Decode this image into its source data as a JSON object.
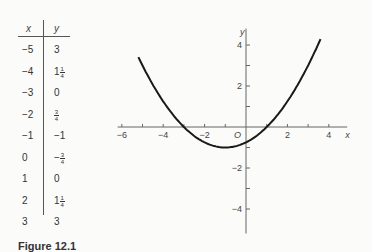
{
  "table": {
    "headers": {
      "x": "x",
      "y": "y"
    },
    "rows": [
      {
        "x": "−5",
        "y": "3"
      },
      {
        "x": "−4",
        "y": "1",
        "y_frac": {
          "num": "1",
          "den": "4"
        }
      },
      {
        "x": "−3",
        "y": "0"
      },
      {
        "x": "−2",
        "y": "",
        "y_frac": {
          "num": "3",
          "den": "4"
        }
      },
      {
        "x": "−1",
        "y": "−1"
      },
      {
        "x": "0",
        "y": "−",
        "y_frac": {
          "num": "3",
          "den": "4"
        }
      },
      {
        "x": "1",
        "y": "0"
      },
      {
        "x": "2",
        "y": "1",
        "y_frac": {
          "num": "1",
          "den": "4"
        }
      },
      {
        "x": "3",
        "y": "3"
      }
    ]
  },
  "caption": "Figure 12.1",
  "chart_data": {
    "type": "line",
    "title": "",
    "xlabel": "x",
    "ylabel": "y",
    "origin_label": "O",
    "equation": "y = (1/4)(x+1)^2 - 1",
    "x_ticks": [
      -6,
      -4,
      -2,
      0,
      2,
      4
    ],
    "x_tick_labels": [
      "−6",
      "−4",
      "−2",
      "",
      "2",
      "4"
    ],
    "y_ticks": [
      -4,
      -2,
      2,
      4
    ],
    "y_tick_labels": [
      "−4",
      "−2",
      "2",
      "4"
    ],
    "xlim": [
      -6.2,
      4.5
    ],
    "ylim": [
      -5,
      4.8
    ],
    "grid": false,
    "series": [
      {
        "name": "parabola",
        "x": [
          -5,
          -4,
          -3,
          -2,
          -1,
          0,
          1,
          2,
          3
        ],
        "y": [
          3,
          1.25,
          0,
          -0.75,
          -1,
          -0.75,
          0,
          1.25,
          3
        ]
      }
    ],
    "curve_range": [
      -5.2,
      3.6
    ]
  }
}
